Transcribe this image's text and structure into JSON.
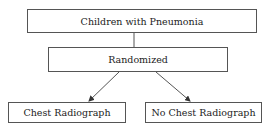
{
  "diagram": {
    "nodes": {
      "root": {
        "label": "Children with Pneumonia"
      },
      "randomized": {
        "label": "Randomized"
      },
      "left": {
        "label": "Chest Radiograph"
      },
      "right": {
        "label": "No Chest Radiograph"
      }
    },
    "edges": [
      {
        "from": "root",
        "to": "randomized",
        "type": "line"
      },
      {
        "from": "randomized",
        "to": "left",
        "type": "arrow"
      },
      {
        "from": "randomized",
        "to": "right",
        "type": "arrow"
      }
    ]
  }
}
